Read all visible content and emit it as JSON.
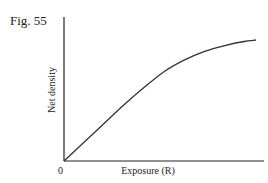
{
  "figure": {
    "label": "Fig. 55"
  },
  "chart_data": {
    "type": "line",
    "title": "Fig. 55",
    "xlabel": "Exposure (R)",
    "ylabel": "Net density",
    "x_tick_labels": [
      "0"
    ],
    "y_tick_labels": [],
    "grid": false,
    "legend": null,
    "xlim": [
      0,
      1
    ],
    "ylim": [
      0,
      1
    ],
    "series": [
      {
        "name": "Net density vs exposure",
        "description": "Linear rise from origin, then gradual shoulder/saturation",
        "x": [
          0.0,
          0.1,
          0.2,
          0.3,
          0.4,
          0.5,
          0.6,
          0.7,
          0.8,
          0.9,
          0.96
        ],
        "y": [
          0.0,
          0.13,
          0.26,
          0.39,
          0.51,
          0.62,
          0.7,
          0.76,
          0.8,
          0.83,
          0.84
        ]
      }
    ]
  },
  "axes": {
    "origin_label": "0",
    "x_label": "Exposure (R)",
    "y_label": "Net density"
  },
  "colors": {
    "line": "#333333",
    "axis": "#222222",
    "background": "#ffffff"
  }
}
